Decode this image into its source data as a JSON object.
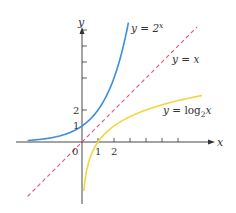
{
  "chart_data": {
    "type": "line",
    "title": "",
    "xlabel": "x",
    "ylabel": "y",
    "origin_label": "0",
    "x_tick_labels": [
      "1",
      "2"
    ],
    "y_tick_labels": [
      "1",
      "2"
    ],
    "x_ticks": [
      1,
      2,
      3,
      4,
      5,
      6
    ],
    "y_ticks": [
      2,
      4,
      5,
      6,
      7
    ],
    "xlim": [
      -4.1,
      8.2
    ],
    "ylim": [
      -3.8,
      7.8
    ],
    "grid": false,
    "legend_position": "inline labels",
    "series": [
      {
        "name": "y = 2^x",
        "label_base": "y = 2",
        "label_sup": "x",
        "color": "#3d8fd9",
        "style": "solid",
        "x": [
          -3.4,
          -3,
          -2,
          -1,
          0,
          0.5,
          1,
          1.5,
          2,
          2.5,
          2.9
        ],
        "y": [
          0.09,
          0.125,
          0.25,
          0.5,
          1,
          1.41,
          2,
          2.83,
          4,
          5.66,
          7.46
        ]
      },
      {
        "name": "y = x",
        "label": "y = x",
        "color": "#e0567a",
        "style": "dashed",
        "x": [
          -3.4,
          7.2
        ],
        "y": [
          -3.4,
          7.2
        ]
      },
      {
        "name": "y = log2x",
        "label_base": "y = log",
        "label_sub": "2",
        "label_tail": "x",
        "color": "#f2d641",
        "style": "solid",
        "x": [
          0.12,
          0.25,
          0.5,
          1,
          2,
          3,
          4,
          5,
          6,
          7.5
        ],
        "y": [
          -3.06,
          -2,
          -1,
          0,
          1,
          1.58,
          2,
          2.32,
          2.58,
          2.91
        ]
      }
    ]
  }
}
